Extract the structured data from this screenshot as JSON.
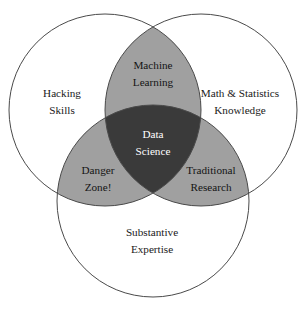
{
  "diagram": {
    "type": "venn-3-set",
    "canvas": {
      "width": 307,
      "height": 314,
      "background": "#ffffff"
    },
    "colors": {
      "outer_fill": "#ffffff",
      "pair_overlap_fill": "#a0a0a0",
      "triple_overlap_fill": "#3a3a3a",
      "stroke": "#4a4a4a",
      "outer_text": "#1a1a1a",
      "pair_text": "#141414",
      "center_text": "#ffffff"
    },
    "circles": [
      {
        "id": "hacking-skills",
        "cx": 105,
        "cy": 110,
        "r": 96
      },
      {
        "id": "math-statistics-knowledge",
        "cx": 201,
        "cy": 110,
        "r": 96
      },
      {
        "id": "substantive-expertise",
        "cx": 153,
        "cy": 201,
        "r": 96
      }
    ],
    "regions": {
      "hacking_skills": {
        "line1": "Hacking",
        "line2": "Skills",
        "x": 62,
        "y": 100
      },
      "math_stats": {
        "line1": "Math & Statistics",
        "line2": "Knowledge",
        "x": 240,
        "y": 100
      },
      "substantive_expertise": {
        "line1": "Substantive",
        "line2": "Expertise",
        "x": 152,
        "y": 240
      },
      "machine_learning": {
        "line1": "Machine",
        "line2": "Learning",
        "x": 153,
        "y": 73
      },
      "danger_zone": {
        "line1": "Danger",
        "line2": "Zone!",
        "x": 98,
        "y": 178
      },
      "traditional_research": {
        "line1": "Traditional",
        "line2": "Research",
        "x": 210,
        "y": 178
      },
      "data_science": {
        "line1": "Data",
        "line2": "Science",
        "x": 153,
        "y": 142
      }
    }
  }
}
